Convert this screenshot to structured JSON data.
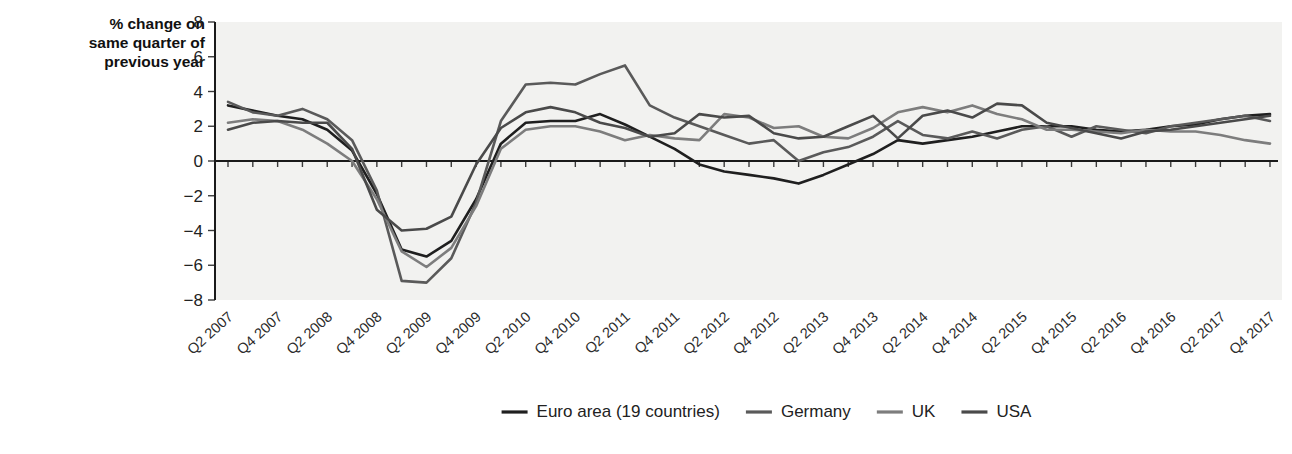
{
  "chart_data": {
    "type": "line",
    "title": "",
    "ylabel": "% change on same quarter of previous year",
    "xlabel": "",
    "ylim": [
      -8,
      8
    ],
    "yticks": [
      8,
      6,
      4,
      2,
      0,
      -2,
      -4,
      -6,
      -8
    ],
    "ytick_labels": [
      "8",
      "6",
      "4",
      "2",
      "0",
      "−2",
      "−4",
      "−6",
      "−8"
    ],
    "grid": false,
    "legend_position": "bottom",
    "zero_line": true,
    "categories": [
      "Q2 2007",
      "Q3 2007",
      "Q4 2007",
      "Q1 2008",
      "Q2 2008",
      "Q3 2008",
      "Q4 2008",
      "Q1 2009",
      "Q2 2009",
      "Q3 2009",
      "Q4 2009",
      "Q1 2010",
      "Q2 2010",
      "Q3 2010",
      "Q4 2010",
      "Q1 2011",
      "Q2 2011",
      "Q3 2011",
      "Q4 2011",
      "Q1 2012",
      "Q2 2012",
      "Q3 2012",
      "Q4 2012",
      "Q1 2013",
      "Q2 2013",
      "Q3 2013",
      "Q4 2013",
      "Q1 2014",
      "Q2 2014",
      "Q3 2014",
      "Q4 2014",
      "Q1 2015",
      "Q2 2015",
      "Q3 2015",
      "Q4 2015",
      "Q1 2016",
      "Q2 2016",
      "Q3 2016",
      "Q4 2016",
      "Q1 2017",
      "Q2 2017",
      "Q3 2017",
      "Q4 2017"
    ],
    "xtick_labels": [
      "Q2 2007",
      "Q4 2007",
      "Q2 2008",
      "Q4 2008",
      "Q2 2009",
      "Q4 2009",
      "Q2 2010",
      "Q4 2010",
      "Q2 2011",
      "Q4 2011",
      "Q2 2012",
      "Q4 2012",
      "Q2 2013",
      "Q4 2013",
      "Q2 2014",
      "Q4 2014",
      "Q2 2015",
      "Q4 2015",
      "Q2 2016",
      "Q4 2016",
      "Q2 2017",
      "Q4 2017"
    ],
    "xtick_indices": [
      0,
      2,
      4,
      6,
      8,
      10,
      12,
      14,
      16,
      18,
      20,
      22,
      24,
      26,
      28,
      30,
      32,
      34,
      36,
      38,
      40,
      42
    ],
    "series": [
      {
        "name": "Euro area (19 countries)",
        "color": "#1f1f1f",
        "values": [
          3.2,
          2.9,
          2.6,
          2.4,
          1.8,
          0.6,
          -1.9,
          -5.1,
          -5.5,
          -4.6,
          -2.2,
          1.0,
          2.2,
          2.3,
          2.3,
          2.7,
          2.1,
          1.4,
          0.7,
          -0.2,
          -0.6,
          -0.8,
          -1.0,
          -1.3,
          -0.8,
          -0.2,
          0.4,
          1.2,
          1.0,
          1.2,
          1.4,
          1.7,
          2.0,
          2.0,
          2.0,
          1.8,
          1.7,
          1.8,
          2.0,
          2.1,
          2.4,
          2.6,
          2.7
        ]
      },
      {
        "name": "Germany",
        "color": "#5a5a5a",
        "values": [
          3.4,
          2.8,
          2.6,
          3.0,
          2.4,
          1.2,
          -1.7,
          -6.9,
          -7.0,
          -5.6,
          -2.4,
          2.3,
          4.4,
          4.5,
          4.4,
          5.0,
          5.5,
          3.2,
          2.5,
          2.0,
          1.5,
          1.0,
          1.2,
          0.0,
          0.5,
          0.8,
          1.4,
          2.3,
          1.5,
          1.3,
          1.7,
          1.3,
          1.8,
          2.0,
          1.4,
          2.0,
          1.8,
          1.6,
          2.0,
          2.2,
          2.4,
          2.6,
          2.3
        ]
      },
      {
        "name": "UK",
        "color": "#7d7d7d",
        "values": [
          2.2,
          2.4,
          2.3,
          1.8,
          1.0,
          0.0,
          -2.2,
          -5.2,
          -6.1,
          -5.0,
          -2.6,
          0.7,
          1.8,
          2.0,
          2.0,
          1.7,
          1.2,
          1.5,
          1.3,
          1.2,
          2.7,
          2.5,
          1.9,
          2.0,
          1.4,
          1.3,
          1.9,
          2.8,
          3.1,
          2.8,
          3.2,
          2.7,
          2.4,
          1.8,
          1.8,
          1.7,
          1.6,
          1.8,
          1.7,
          1.7,
          1.5,
          1.2,
          1.0
        ]
      },
      {
        "name": "USA",
        "color": "#4a4a4a",
        "values": [
          1.8,
          2.2,
          2.3,
          2.2,
          2.2,
          0.7,
          -2.8,
          -4.0,
          -3.9,
          -3.2,
          -0.2,
          1.9,
          2.8,
          3.1,
          2.8,
          2.2,
          1.9,
          1.4,
          1.6,
          2.7,
          2.5,
          2.6,
          1.6,
          1.3,
          1.4,
          2.0,
          2.6,
          1.3,
          2.6,
          2.9,
          2.5,
          3.3,
          3.2,
          2.2,
          1.9,
          1.6,
          1.3,
          1.7,
          1.8,
          2.0,
          2.2,
          2.4,
          2.6
        ]
      }
    ]
  },
  "legend": {
    "items": [
      {
        "label": "Euro area (19 countries)",
        "color": "#1f1f1f"
      },
      {
        "label": "Germany",
        "color": "#5a5a5a"
      },
      {
        "label": "UK",
        "color": "#7d7d7d"
      },
      {
        "label": "USA",
        "color": "#4a4a4a"
      }
    ]
  },
  "axis_title_lines": [
    "% change on",
    "same quarter of",
    "previous year"
  ]
}
